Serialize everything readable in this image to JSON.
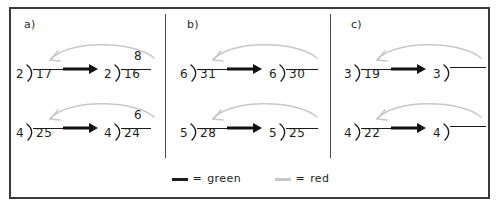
{
  "figure": {
    "width": 501,
    "height": 215,
    "background": "#ffffff",
    "border_color": "#3a3a3a",
    "divider_color": "#4a4a4a"
  },
  "colors": {
    "ink": "#1d1d1d",
    "green_line": "#1d1d1d",
    "red_line": "#c8c8c8",
    "frame": "#3a3a3a"
  },
  "legend": {
    "items": [
      {
        "swatch": "dark-line-swatch",
        "equals": "=",
        "label": "green",
        "color": "#1d1d1d"
      },
      {
        "swatch": "light-line-swatch",
        "equals": "=",
        "label": "red",
        "color": "#c8c8c8"
      }
    ]
  },
  "panels": [
    {
      "id": "a",
      "label": "a)",
      "rows": [
        {
          "id": "a1",
          "before": {
            "divisor": "2",
            "dividend": "17",
            "quotient": ""
          },
          "after": {
            "divisor": "2",
            "dividend": "16",
            "quotient": "8"
          },
          "transform_arrow": "right-arrow",
          "curved_arrow": "curved-left-arrow"
        },
        {
          "id": "a2",
          "before": {
            "divisor": "4",
            "dividend": "25",
            "quotient": ""
          },
          "after": {
            "divisor": "4",
            "dividend": "24",
            "quotient": "6"
          },
          "transform_arrow": "right-arrow",
          "curved_arrow": "curved-left-arrow"
        }
      ]
    },
    {
      "id": "b",
      "label": "b)",
      "rows": [
        {
          "id": "b1",
          "before": {
            "divisor": "6",
            "dividend": "31",
            "quotient": ""
          },
          "after": {
            "divisor": "6",
            "dividend": "30",
            "quotient": ""
          },
          "transform_arrow": "right-arrow",
          "curved_arrow": "curved-left-arrow"
        },
        {
          "id": "b2",
          "before": {
            "divisor": "5",
            "dividend": "28",
            "quotient": ""
          },
          "after": {
            "divisor": "5",
            "dividend": "25",
            "quotient": ""
          },
          "transform_arrow": "right-arrow",
          "curved_arrow": "curved-left-arrow"
        }
      ]
    },
    {
      "id": "c",
      "label": "c)",
      "rows": [
        {
          "id": "c1",
          "before": {
            "divisor": "3",
            "dividend": "19",
            "quotient": ""
          },
          "after": {
            "divisor": "3",
            "dividend": "",
            "quotient": ""
          },
          "transform_arrow": "right-arrow",
          "curved_arrow": "curved-left-arrow"
        },
        {
          "id": "c2",
          "before": {
            "divisor": "4",
            "dividend": "22",
            "quotient": ""
          },
          "after": {
            "divisor": "4",
            "dividend": "",
            "quotient": ""
          },
          "transform_arrow": "right-arrow",
          "curved_arrow": "curved-left-arrow"
        }
      ]
    }
  ]
}
